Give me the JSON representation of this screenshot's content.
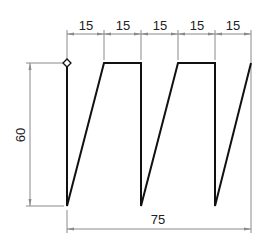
{
  "drawing": {
    "title": "Sawtooth / trapezoidal waveform profile",
    "top_dimensions": [
      "15",
      "15",
      "15",
      "15",
      "15"
    ],
    "height_dimension": "60",
    "total_width_dimension": "75",
    "colors": {
      "profile": "#111111",
      "dimension_lines": "#8a8a8a",
      "text": "#222222"
    },
    "start_marker": "diamond-marker"
  }
}
